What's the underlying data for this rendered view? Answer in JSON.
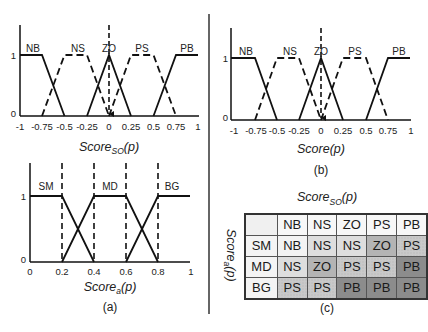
{
  "panel_a_top": {
    "y_ticks": [
      "1",
      "0"
    ],
    "x_ticks": [
      "-1",
      "-0.75",
      "-0.5",
      "-0.25",
      "0",
      "0.25",
      "0.5",
      "0.75",
      "1"
    ],
    "sets": [
      "NB",
      "NS",
      "ZO",
      "PS",
      "PB"
    ],
    "title_main": "Score",
    "title_sub": "SO",
    "title_tail": "(p)"
  },
  "panel_a_bottom": {
    "y_ticks": [
      "1",
      "0"
    ],
    "x_ticks": [
      "0",
      "0.2",
      "0.4",
      "0.6",
      "0.8",
      "1"
    ],
    "sets": [
      "SM",
      "MD",
      "BG"
    ],
    "title_main": "Score",
    "title_sub": "a",
    "title_tail": "(p)",
    "caption": "(a)"
  },
  "panel_b": {
    "y_ticks": [
      "1",
      "0"
    ],
    "x_ticks": [
      "-1",
      "-0.75",
      "-0.5",
      "-0.25",
      "0",
      "0.25",
      "0.5",
      "0.75",
      "1"
    ],
    "sets": [
      "NB",
      "NS",
      "ZO",
      "PS",
      "PB"
    ],
    "title": "Score(p)",
    "caption": "(b)"
  },
  "panel_c": {
    "col_title_main": "Score",
    "col_title_sub": "SO",
    "col_title_tail": "(p)",
    "row_title_main": "Score",
    "row_title_sub": "a",
    "row_title_tail": "(p)",
    "columns": [
      "NB",
      "NS",
      "ZO",
      "PS",
      "PB"
    ],
    "rows": [
      {
        "label": "SM",
        "cells": [
          "NB",
          "NS",
          "NS",
          "ZO",
          "PS"
        ]
      },
      {
        "label": "MD",
        "cells": [
          "NS",
          "ZO",
          "PS",
          "PS",
          "PB"
        ]
      },
      {
        "label": "BG",
        "cells": [
          "PS",
          "PS",
          "PB",
          "PB",
          "PB"
        ]
      }
    ],
    "caption": "(c)",
    "cell_colors": {
      "NB": "#f3f3f3",
      "NS": "#dedede",
      "ZO": "#b4b4b4",
      "PS": "#c9c9c9",
      "PB": "#8c8c8c"
    }
  }
}
